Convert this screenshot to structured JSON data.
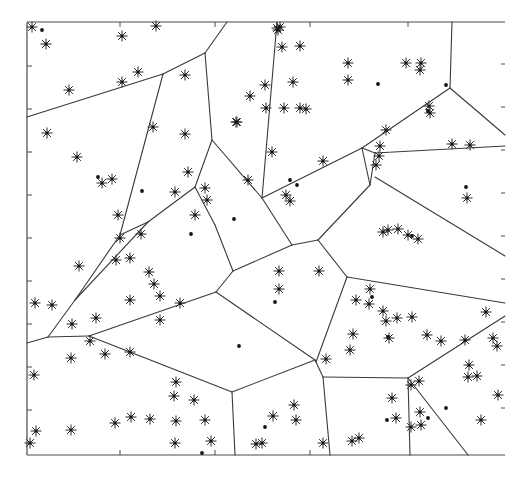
{
  "figure": {
    "type": "voronoi-diagram",
    "frame": {
      "left": 27,
      "top": 22,
      "right": 505,
      "bottom": 455
    },
    "colors": {
      "edge": "#3a3a3a",
      "marker": "#111111",
      "background": "#ffffff"
    },
    "ticks": {
      "bottom": [
        120,
        215,
        310
      ],
      "top": [
        120,
        215,
        310,
        408
      ],
      "left": [
        66,
        109,
        152,
        195,
        238,
        281,
        324,
        367,
        410
      ],
      "right": [
        64,
        107,
        150,
        193,
        236,
        279,
        322,
        365,
        408
      ]
    },
    "edges": [
      [
        [
          27,
          117
        ],
        [
          163,
          74
        ]
      ],
      [
        [
          163,
          74
        ],
        [
          205,
          53
        ]
      ],
      [
        [
          205,
          53
        ],
        [
          227,
          22
        ]
      ],
      [
        [
          163,
          74
        ],
        [
          120,
          235
        ]
      ],
      [
        [
          205,
          53
        ],
        [
          212,
          140
        ]
      ],
      [
        [
          212,
          140
        ],
        [
          195,
          187
        ]
      ],
      [
        [
          212,
          140
        ],
        [
          262,
          198
        ]
      ],
      [
        [
          262,
          198
        ],
        [
          277,
          22
        ]
      ],
      [
        [
          195,
          187
        ],
        [
          148,
          222
        ]
      ],
      [
        [
          195,
          187
        ],
        [
          215,
          225
        ]
      ],
      [
        [
          148,
          222
        ],
        [
          120,
          235
        ]
      ],
      [
        [
          120,
          235
        ],
        [
          75,
          300
        ]
      ],
      [
        [
          148,
          222
        ],
        [
          75,
          300
        ]
      ],
      [
        [
          75,
          300
        ],
        [
          48,
          337
        ]
      ],
      [
        [
          27,
          343
        ],
        [
          48,
          337
        ]
      ],
      [
        [
          48,
          337
        ],
        [
          89,
          336
        ]
      ],
      [
        [
          89,
          336
        ],
        [
          216,
          292
        ]
      ],
      [
        [
          89,
          336
        ],
        [
          232,
          392
        ]
      ],
      [
        [
          215,
          225
        ],
        [
          233,
          271
        ]
      ],
      [
        [
          233,
          271
        ],
        [
          216,
          292
        ]
      ],
      [
        [
          233,
          271
        ],
        [
          292,
          245
        ]
      ],
      [
        [
          262,
          198
        ],
        [
          292,
          245
        ]
      ],
      [
        [
          292,
          245
        ],
        [
          318,
          240
        ]
      ],
      [
        [
          318,
          240
        ],
        [
          370,
          185
        ]
      ],
      [
        [
          318,
          240
        ],
        [
          347,
          277
        ]
      ],
      [
        [
          362,
          148
        ],
        [
          370,
          185
        ]
      ],
      [
        [
          262,
          198
        ],
        [
          362,
          148
        ]
      ],
      [
        [
          362,
          148
        ],
        [
          450,
          88
        ]
      ],
      [
        [
          450,
          88
        ],
        [
          452,
          22
        ]
      ],
      [
        [
          450,
          88
        ],
        [
          505,
          135
        ]
      ],
      [
        [
          370,
          185
        ],
        [
          375,
          153
        ]
      ],
      [
        [
          375,
          153
        ],
        [
          505,
          146
        ]
      ],
      [
        [
          375,
          153
        ],
        [
          362,
          148
        ]
      ],
      [
        [
          375,
          177
        ],
        [
          505,
          256
        ]
      ],
      [
        [
          347,
          277
        ],
        [
          505,
          303
        ]
      ],
      [
        [
          347,
          277
        ],
        [
          316,
          362
        ]
      ],
      [
        [
          216,
          292
        ],
        [
          315,
          360
        ]
      ],
      [
        [
          315,
          360
        ],
        [
          232,
          392
        ]
      ],
      [
        [
          232,
          392
        ],
        [
          235,
          455
        ]
      ],
      [
        [
          315,
          360
        ],
        [
          323,
          377
        ]
      ],
      [
        [
          323,
          377
        ],
        [
          330,
          455
        ]
      ],
      [
        [
          323,
          377
        ],
        [
          408,
          378
        ]
      ],
      [
        [
          408,
          378
        ],
        [
          410,
          455
        ]
      ],
      [
        [
          408,
          378
        ],
        [
          468,
          455
        ]
      ],
      [
        [
          408,
          378
        ],
        [
          505,
          316
        ]
      ]
    ],
    "generators_star": [
      [
        32,
        27
      ],
      [
        46,
        44
      ],
      [
        122,
        36
      ],
      [
        156,
        26
      ],
      [
        69,
        90
      ],
      [
        122,
        82
      ],
      [
        138,
        72
      ],
      [
        185,
        75
      ],
      [
        47,
        133
      ],
      [
        77,
        157
      ],
      [
        102,
        183
      ],
      [
        112,
        179
      ],
      [
        120,
        238
      ],
      [
        153,
        127
      ],
      [
        185,
        134
      ],
      [
        188,
        172
      ],
      [
        175,
        192
      ],
      [
        205,
        188
      ],
      [
        207,
        200
      ],
      [
        195,
        215
      ],
      [
        237,
        122
      ],
      [
        248,
        180
      ],
      [
        277,
        28
      ],
      [
        280,
        27
      ],
      [
        278,
        30
      ],
      [
        282,
        47
      ],
      [
        300,
        46
      ],
      [
        348,
        63
      ],
      [
        348,
        80
      ],
      [
        300,
        108
      ],
      [
        293,
        82
      ],
      [
        236,
        122
      ],
      [
        286,
        195
      ],
      [
        290,
        201
      ],
      [
        306,
        109
      ],
      [
        266,
        108
      ],
      [
        284,
        108
      ],
      [
        250,
        96
      ],
      [
        265,
        85
      ],
      [
        323,
        161
      ],
      [
        379,
        156
      ],
      [
        406,
        63
      ],
      [
        421,
        63
      ],
      [
        420,
        70
      ],
      [
        429,
        106
      ],
      [
        430,
        113
      ],
      [
        452,
        144
      ],
      [
        470,
        145
      ],
      [
        467,
        198
      ],
      [
        376,
        165
      ],
      [
        386,
        130
      ],
      [
        380,
        146
      ],
      [
        383,
        232
      ],
      [
        408,
        235
      ],
      [
        418,
        239
      ],
      [
        398,
        229
      ],
      [
        388,
        230
      ],
      [
        272,
        152
      ],
      [
        118,
        215
      ],
      [
        141,
        234
      ],
      [
        130,
        258
      ],
      [
        116,
        260
      ],
      [
        130,
        300
      ],
      [
        149,
        272
      ],
      [
        79,
        266
      ],
      [
        52,
        305
      ],
      [
        35,
        303
      ],
      [
        72,
        324
      ],
      [
        96,
        318
      ],
      [
        90,
        341
      ],
      [
        160,
        296
      ],
      [
        160,
        320
      ],
      [
        154,
        284
      ],
      [
        180,
        303
      ],
      [
        71,
        358
      ],
      [
        105,
        354
      ],
      [
        130,
        352
      ],
      [
        176,
        382
      ],
      [
        174,
        396
      ],
      [
        194,
        400
      ],
      [
        205,
        420
      ],
      [
        211,
        441
      ],
      [
        175,
        443
      ],
      [
        176,
        421
      ],
      [
        150,
        419
      ],
      [
        131,
        417
      ],
      [
        115,
        423
      ],
      [
        71,
        430
      ],
      [
        36,
        431
      ],
      [
        34,
        375
      ],
      [
        30,
        443
      ],
      [
        279,
        271
      ],
      [
        279,
        289
      ],
      [
        319,
        271
      ],
      [
        326,
        359
      ],
      [
        273,
        416
      ],
      [
        294,
        405
      ],
      [
        296,
        420
      ],
      [
        262,
        443
      ],
      [
        256,
        444
      ],
      [
        323,
        443
      ],
      [
        352,
        441
      ],
      [
        359,
        438
      ],
      [
        392,
        398
      ],
      [
        396,
        418
      ],
      [
        420,
        412
      ],
      [
        421,
        425
      ],
      [
        411,
        427
      ],
      [
        481,
        420
      ],
      [
        353,
        334
      ],
      [
        370,
        289
      ],
      [
        356,
        300
      ],
      [
        369,
        304
      ],
      [
        383,
        311
      ],
      [
        386,
        321
      ],
      [
        397,
        318
      ],
      [
        412,
        317
      ],
      [
        389,
        338
      ],
      [
        427,
        335
      ],
      [
        441,
        341
      ],
      [
        465,
        340
      ],
      [
        469,
        365
      ],
      [
        468,
        377
      ],
      [
        477,
        376
      ],
      [
        486,
        312
      ],
      [
        493,
        338
      ],
      [
        497,
        346
      ],
      [
        498,
        395
      ],
      [
        411,
        385
      ],
      [
        419,
        381
      ],
      [
        350,
        350
      ]
    ],
    "generators_dot": [
      [
        42,
        30
      ],
      [
        98,
        177
      ],
      [
        142,
        191
      ],
      [
        191,
        234
      ],
      [
        234,
        219
      ],
      [
        290,
        180
      ],
      [
        297,
        185
      ],
      [
        378,
        84
      ],
      [
        446,
        85
      ],
      [
        428,
        111
      ],
      [
        412,
        236
      ],
      [
        466,
        187
      ],
      [
        275,
        302
      ],
      [
        239,
        346
      ],
      [
        388,
        337
      ],
      [
        387,
        420
      ],
      [
        428,
        418
      ],
      [
        446,
        408
      ],
      [
        372,
        297
      ],
      [
        202,
        453
      ],
      [
        265,
        427
      ]
    ]
  }
}
